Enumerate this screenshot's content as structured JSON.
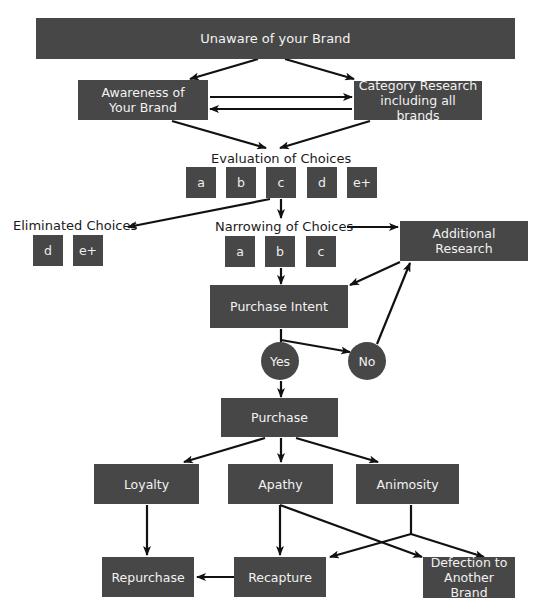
{
  "diagram": {
    "type": "flowchart",
    "colors": {
      "box": "#474747",
      "box_text": "#f2f2f2",
      "arrow": "#111111",
      "label_text": "#1a1a1a"
    },
    "nodes": {
      "unaware": "Unaware of your Brand",
      "awareness": "Awareness of Your Brand",
      "category_research": "Category Research including all brands",
      "evaluation": {
        "label": "Evaluation of Choices",
        "choices": [
          "a",
          "b",
          "c",
          "d",
          "e+"
        ]
      },
      "eliminated": {
        "label": "Eliminated Choices",
        "choices": [
          "d",
          "e+"
        ]
      },
      "narrowing": {
        "label": "Narrowing of Choices",
        "choices": [
          "a",
          "b",
          "c"
        ]
      },
      "additional_research": "Additional Research",
      "purchase_intent": "Purchase Intent",
      "yes": "Yes",
      "no": "No",
      "purchase": "Purchase",
      "loyalty": "Loyalty",
      "apathy": "Apathy",
      "animosity": "Animosity",
      "repurchase": "Repurchase",
      "recapture": "Recapture",
      "defection": "Defection to Another Brand"
    },
    "edges": [
      [
        "unaware",
        "awareness"
      ],
      [
        "unaware",
        "category_research"
      ],
      [
        "awareness",
        "category_research"
      ],
      [
        "category_research",
        "awareness"
      ],
      [
        "awareness",
        "evaluation"
      ],
      [
        "category_research",
        "evaluation"
      ],
      [
        "evaluation",
        "eliminated"
      ],
      [
        "evaluation",
        "narrowing"
      ],
      [
        "narrowing",
        "additional_research"
      ],
      [
        "narrowing",
        "purchase_intent"
      ],
      [
        "additional_research",
        "purchase_intent"
      ],
      [
        "purchase_intent",
        "yes"
      ],
      [
        "purchase_intent",
        "no"
      ],
      [
        "no",
        "additional_research"
      ],
      [
        "yes",
        "purchase"
      ],
      [
        "purchase",
        "loyalty"
      ],
      [
        "purchase",
        "apathy"
      ],
      [
        "purchase",
        "animosity"
      ],
      [
        "loyalty",
        "repurchase"
      ],
      [
        "apathy",
        "recapture"
      ],
      [
        "apathy",
        "defection"
      ],
      [
        "animosity",
        "recapture"
      ],
      [
        "animosity",
        "defection"
      ],
      [
        "recapture",
        "repurchase"
      ]
    ]
  }
}
